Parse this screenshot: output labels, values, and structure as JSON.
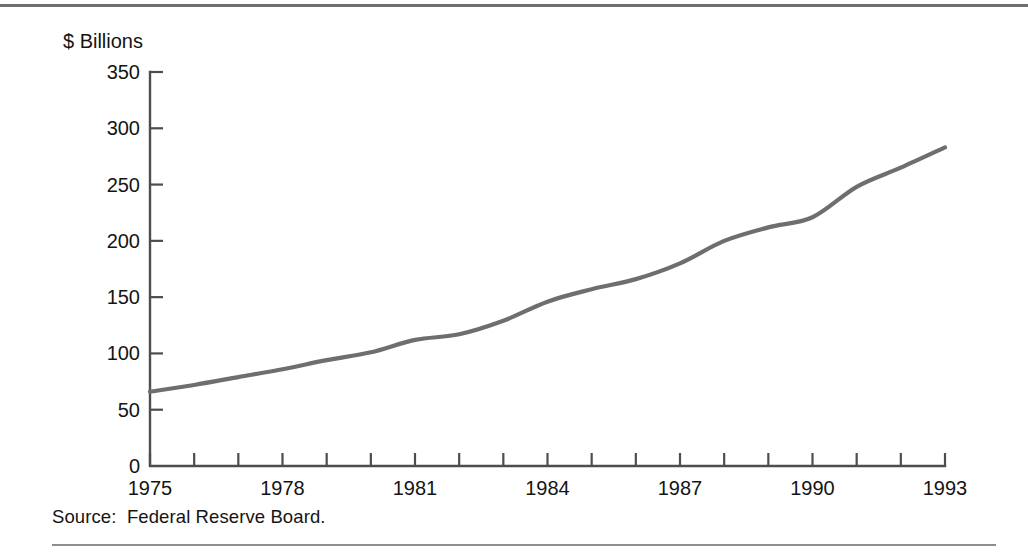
{
  "figure": {
    "source_note": "Source:  Federal Reserve Board.",
    "line_color": "#6e6e6e",
    "axis_color": "#4d4d4d",
    "background_color": "#ffffff"
  },
  "chart_data": {
    "type": "line",
    "title": "",
    "subtitle": "",
    "xlabel": "",
    "ylabel": "$ Billions",
    "ylim": [
      0,
      350
    ],
    "xlim": [
      1975,
      1993
    ],
    "grid": false,
    "legend": "none",
    "y_ticks": [
      0,
      50,
      100,
      150,
      200,
      250,
      300,
      350
    ],
    "y_tick_labels": [
      "0",
      "50",
      "100",
      "150",
      "200",
      "250",
      "300",
      "350"
    ],
    "x_ticks": [
      1975,
      1976,
      1977,
      1978,
      1979,
      1980,
      1981,
      1982,
      1983,
      1984,
      1985,
      1986,
      1987,
      1988,
      1989,
      1990,
      1991,
      1992,
      1993
    ],
    "x_tick_labels": [
      "1975",
      "",
      "",
      "1978",
      "",
      "",
      "1981",
      "",
      "",
      "1984",
      "",
      "",
      "1987",
      "",
      "",
      "1990",
      "",
      "",
      "1993"
    ],
    "x_labeled_ticks": [
      "1975",
      "1978",
      "1981",
      "1984",
      "1987",
      "1990",
      "1993"
    ],
    "x": [
      1975,
      1976,
      1977,
      1978,
      1979,
      1980,
      1981,
      1982,
      1983,
      1984,
      1985,
      1986,
      1987,
      1988,
      1989,
      1990,
      1991,
      1992,
      1993
    ],
    "values": [
      66,
      72,
      79,
      86,
      94,
      101,
      112,
      117,
      129,
      146,
      157,
      166,
      180,
      200,
      212,
      221,
      248,
      265,
      283
    ],
    "series": [
      {
        "name": "",
        "values": [
          66,
          72,
          79,
          86,
          94,
          101,
          112,
          117,
          129,
          146,
          157,
          166,
          180,
          200,
          212,
          221,
          248,
          265,
          283
        ]
      }
    ]
  }
}
